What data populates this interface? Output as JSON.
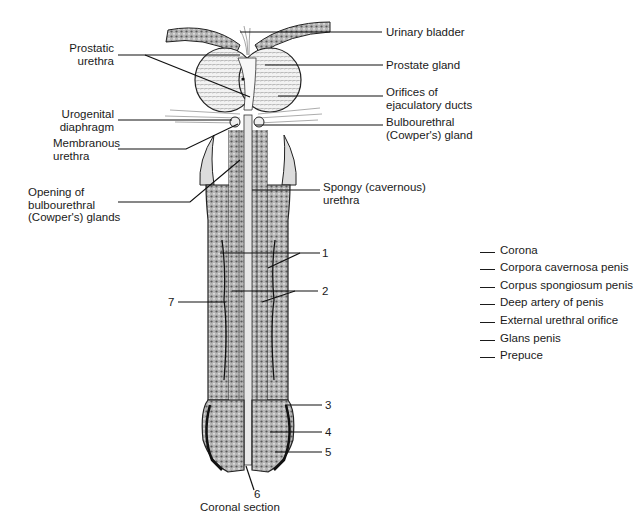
{
  "labels": {
    "urinary_bladder": "Urinary bladder",
    "prostatic_urethra": "Prostatic\nurethra",
    "prostate_gland": "Prostate gland",
    "orifices_ejaculatory": "Orifices of\nejaculatory ducts",
    "urogenital_diaphragm": "Urogenital\ndiaphragm",
    "bulbourethral_gland": "Bulbourethral\n(Cowper's) gland",
    "membranous_urethra": "Membranous\nurethra",
    "opening_bulbourethral": "Opening of\nbulbourethral\n(Cowper's) glands",
    "spongy_urethra": "Spongy (cavernous)\nurethra"
  },
  "numbers": {
    "n1": "1",
    "n2": "2",
    "n3": "3",
    "n4": "4",
    "n5": "5",
    "n6": "6",
    "n7": "7"
  },
  "legend": {
    "items": [
      "Corona",
      "Corpora cavernosa penis",
      "Corpus spongiosum penis",
      "Deep artery of penis",
      "External urethral orifice",
      "Glans penis",
      "Prepuce"
    ]
  },
  "caption": "Coronal section",
  "colors": {
    "ink": "#1a1a1a",
    "tissue_fill": "#9a9a9a",
    "light_fill": "#e6e6e6",
    "background": "#ffffff"
  }
}
